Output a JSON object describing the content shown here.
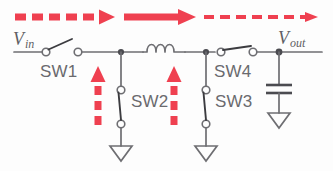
{
  "diagram": {
    "accent_color": "#ef4050",
    "wire_color": "#6e6e72",
    "label_color": "#6a6a6e",
    "background": "#fdfdfd"
  },
  "terminals": {
    "input": {
      "symbol": "V",
      "subscript": "in"
    },
    "output": {
      "symbol": "V",
      "subscript": "out"
    }
  },
  "switches": [
    {
      "id": "sw1",
      "label": "SW1",
      "state": "open",
      "orientation": "horizontal"
    },
    {
      "id": "sw2",
      "label": "SW2",
      "state": "closed",
      "orientation": "vertical"
    },
    {
      "id": "sw3",
      "label": "SW3",
      "state": "closed",
      "orientation": "vertical"
    },
    {
      "id": "sw4",
      "label": "SW4",
      "state": "closed",
      "orientation": "horizontal"
    }
  ],
  "components": [
    {
      "id": "inductor",
      "type": "inductor",
      "coils": 3
    },
    {
      "id": "capacitor",
      "type": "capacitor",
      "plates": 2
    },
    {
      "id": "gnd-sw2",
      "type": "ground"
    },
    {
      "id": "gnd-sw3",
      "type": "ground"
    },
    {
      "id": "gnd-cap",
      "type": "ground"
    }
  ],
  "flow_arrows": {
    "horizontal": [
      {
        "id": "arrow-input-dashed",
        "style": "dashed",
        "weight": "thick",
        "direction": "right"
      },
      {
        "id": "arrow-middle-solid",
        "style": "solid",
        "weight": "thick",
        "direction": "right"
      },
      {
        "id": "arrow-output-dashed",
        "style": "dashed",
        "weight": "thin",
        "direction": "right"
      }
    ],
    "vertical": [
      {
        "id": "arrow-sw2-up",
        "style": "dashed",
        "weight": "thick",
        "direction": "up"
      },
      {
        "id": "arrow-sw3-up",
        "style": "dashed",
        "weight": "thick",
        "direction": "up"
      }
    ]
  }
}
